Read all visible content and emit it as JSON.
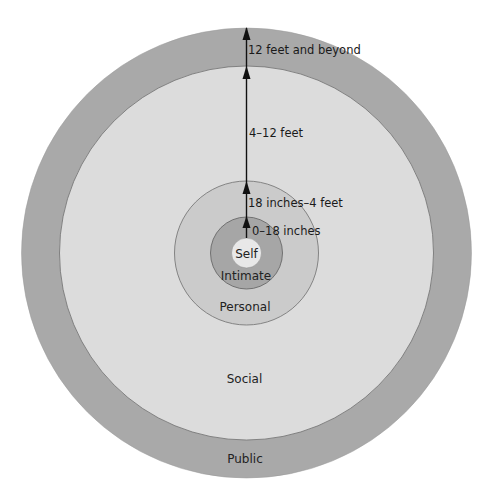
{
  "diagram": {
    "center": {
      "x": 246.5,
      "y": 253
    },
    "colors": {
      "background": "#ffffff",
      "public": "#a9a9a9",
      "social": "#dcdcdc",
      "personal": "#cbcbcb",
      "intimate": "#a6a6a6",
      "self": "#e8e8e8",
      "stroke": "#6e6e6e",
      "arrow": "#111111",
      "text": "#222222"
    },
    "zones": [
      {
        "id": "public",
        "label": "Public",
        "radius": 225,
        "label_y": 463,
        "distance": "12 feet and beyond",
        "distance_y": 23
      },
      {
        "id": "social",
        "label": "Social",
        "radius": 187,
        "label_y": 383,
        "distance": "4–12 feet",
        "distance_y": 137
      },
      {
        "id": "personal",
        "label": "Personal",
        "radius": 72,
        "label_y": 311,
        "distance": "18 inches–4 feet",
        "distance_y": 207
      },
      {
        "id": "intimate",
        "label": "Intimate",
        "radius": 36,
        "label_y": 280,
        "distance": "0–18 inches",
        "distance_y": 235
      },
      {
        "id": "self",
        "label": "Self",
        "radius": 15,
        "label_y": 258
      }
    ]
  }
}
